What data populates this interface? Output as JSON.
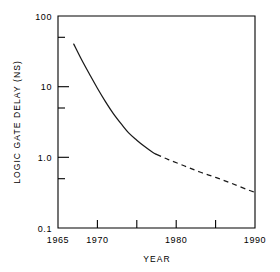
{
  "chart_data": {
    "type": "line",
    "title": "",
    "xlabel": "YEAR",
    "ylabel": "LOGIC GATE DELAY (NS)",
    "xlim": [
      1965,
      1990
    ],
    "ylim": [
      0.1,
      100
    ],
    "yscale": "log",
    "xscale": "linear",
    "grid": false,
    "legend": false,
    "x_ticks": [
      1965,
      1970,
      1975,
      1980,
      1985,
      1990
    ],
    "x_tick_labels": [
      "1965",
      "1970",
      "",
      "1980",
      "",
      "1990"
    ],
    "y_ticks": [
      100,
      50,
      10,
      5,
      1.0,
      0.5,
      0.1
    ],
    "y_tick_labels": [
      "100",
      "",
      "10",
      "",
      "1.0",
      "",
      "0.1"
    ],
    "series": [
      {
        "name": "logic gate delay (historical)",
        "style": "solid",
        "x": [
          1967.0,
          1968.0,
          1969.0,
          1970.0,
          1971.0,
          1972.0,
          1973.0,
          1974.0,
          1975.0,
          1976.0,
          1977.0,
          1977.5
        ],
        "values": [
          40.0,
          24.0,
          15.0,
          9.5,
          6.2,
          4.2,
          3.0,
          2.2,
          1.75,
          1.42,
          1.18,
          1.1
        ]
      },
      {
        "name": "logic gate delay (projected)",
        "style": "dashed",
        "x": [
          1977.5,
          1979.0,
          1981.0,
          1983.0,
          1985.0,
          1987.0,
          1989.0,
          1990.0
        ],
        "values": [
          1.1,
          0.93,
          0.76,
          0.62,
          0.52,
          0.43,
          0.35,
          0.32
        ]
      }
    ],
    "annotations": []
  },
  "axes": {
    "x_title": "YEAR",
    "y_title": "LOGIC GATE DELAY (NS)"
  },
  "tick_text": {
    "y_100": "100",
    "y_10": "10",
    "y_1": "1.0",
    "y_01": "0.1",
    "x_1965": "1965",
    "x_1970": "1970",
    "x_1980": "1980",
    "x_1990": "1990"
  },
  "colors": {
    "background": "#ffffff",
    "ink": "#000000",
    "series": "#1a1a1a"
  }
}
